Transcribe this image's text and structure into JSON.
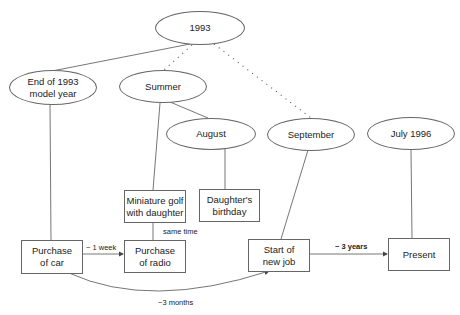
{
  "diagram": {
    "type": "timeline-hierarchy",
    "colors": {
      "stroke": "#666666",
      "text": "#222222",
      "background": "#ffffff"
    },
    "ellipses": [
      {
        "id": "e1993",
        "label": "1993"
      },
      {
        "id": "eEnd",
        "label": "End of 1993\nmodel year"
      },
      {
        "id": "eSummer",
        "label": "Summer"
      },
      {
        "id": "eAugust",
        "label": "August"
      },
      {
        "id": "eSeptember",
        "label": "September"
      },
      {
        "id": "eJuly",
        "label": "July 1996"
      }
    ],
    "boxes": [
      {
        "id": "bGolf",
        "label": "Miniature golf\nwith daughter"
      },
      {
        "id": "bBirthday",
        "label": "Daughter's\nbirthday"
      },
      {
        "id": "bCar",
        "label": "Purchase\nof car"
      },
      {
        "id": "bRadio",
        "label": "Purchase\nof radio"
      },
      {
        "id": "bJob",
        "label": "Start of\nnew job"
      },
      {
        "id": "bPresent",
        "label": "Present"
      }
    ],
    "edge_labels": {
      "car_to_radio": "~ 1 week",
      "golf_radio": "same time",
      "job_to_present": "~ 3 years",
      "car_to_job": "~3 months"
    },
    "edges": [
      {
        "from": "1993",
        "to": "End of 1993 model year",
        "style": "solid"
      },
      {
        "from": "1993",
        "to": "Summer",
        "style": "dotted"
      },
      {
        "from": "1993",
        "to": "September",
        "style": "dotted"
      },
      {
        "from": "Summer",
        "to": "August",
        "style": "solid"
      },
      {
        "from": "Summer",
        "to": "Miniature golf with daughter",
        "style": "solid"
      },
      {
        "from": "August",
        "to": "Daughter's birthday",
        "style": "solid"
      },
      {
        "from": "End of 1993 model year",
        "to": "Purchase of car",
        "style": "solid"
      },
      {
        "from": "September",
        "to": "Start of new job",
        "style": "solid"
      },
      {
        "from": "July 1996",
        "to": "Present",
        "style": "solid"
      },
      {
        "from": "Miniature golf with daughter",
        "to": "Purchase of radio",
        "style": "solid",
        "label": "same time"
      },
      {
        "from": "Purchase of car",
        "to": "Purchase of radio",
        "style": "arrow",
        "label": "~ 1 week"
      },
      {
        "from": "Purchase of car",
        "to": "Start of new job",
        "style": "curved-arrow",
        "label": "~3 months"
      },
      {
        "from": "Start of new job",
        "to": "Present",
        "style": "arrow",
        "label": "~ 3 years"
      }
    ]
  }
}
